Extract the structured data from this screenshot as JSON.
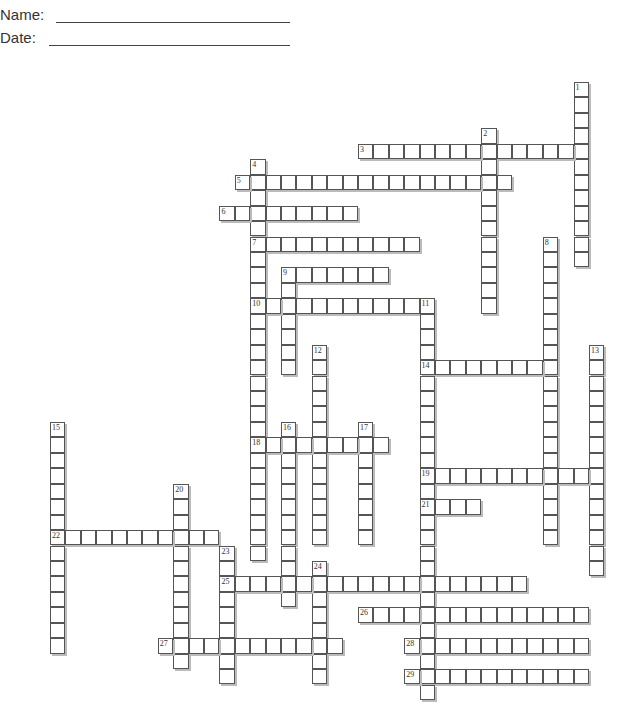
{
  "header": {
    "name_label": "Name:",
    "date_label": "Date:"
  },
  "grid": {
    "origin_x": 50,
    "origin_y": 82,
    "cell": 15.4,
    "cell_h": 15.45
  },
  "entries": [
    {
      "num": 1,
      "dir": "down",
      "row": 0,
      "col": 34,
      "len": 12
    },
    {
      "num": 2,
      "dir": "down",
      "row": 3,
      "col": 28,
      "len": 12
    },
    {
      "num": 3,
      "dir": "across",
      "row": 4,
      "col": 20,
      "len": 15
    },
    {
      "num": 4,
      "dir": "down",
      "row": 5,
      "col": 13,
      "len": 26
    },
    {
      "num": 5,
      "dir": "across",
      "row": 6,
      "col": 12,
      "len": 18
    },
    {
      "num": 6,
      "dir": "across",
      "row": 8,
      "col": 11,
      "len": 9
    },
    {
      "num": 7,
      "dir": "across",
      "row": 10,
      "col": 13,
      "len": 11
    },
    {
      "num": 8,
      "dir": "down",
      "row": 10,
      "col": 32,
      "len": 20
    },
    {
      "num": 9,
      "dir": "across",
      "row": 12,
      "col": 15,
      "len": 7
    },
    {
      "num": 9,
      "dir": "down",
      "row": 12,
      "col": 15,
      "len": 7
    },
    {
      "num": 10,
      "dir": "across",
      "row": 14,
      "col": 13,
      "len": 12
    },
    {
      "num": 11,
      "dir": "down",
      "row": 14,
      "col": 24,
      "len": 26
    },
    {
      "num": 12,
      "dir": "down",
      "row": 17,
      "col": 17,
      "len": 13
    },
    {
      "num": 13,
      "dir": "down",
      "row": 17,
      "col": 35,
      "len": 15
    },
    {
      "num": 14,
      "dir": "across",
      "row": 18,
      "col": 24,
      "len": 9
    },
    {
      "num": 15,
      "dir": "down",
      "row": 22,
      "col": 0,
      "len": 15
    },
    {
      "num": 16,
      "dir": "down",
      "row": 22,
      "col": 15,
      "len": 12
    },
    {
      "num": 17,
      "dir": "down",
      "row": 22,
      "col": 20,
      "len": 8
    },
    {
      "num": 18,
      "dir": "across",
      "row": 23,
      "col": 13,
      "len": 9
    },
    {
      "num": 19,
      "dir": "across",
      "row": 25,
      "col": 24,
      "len": 12
    },
    {
      "num": 20,
      "dir": "down",
      "row": 26,
      "col": 8,
      "len": 12
    },
    {
      "num": 21,
      "dir": "across",
      "row": 27,
      "col": 24,
      "len": 4
    },
    {
      "num": 22,
      "dir": "across",
      "row": 29,
      "col": 0,
      "len": 11
    },
    {
      "num": 23,
      "dir": "down",
      "row": 30,
      "col": 11,
      "len": 9
    },
    {
      "num": 24,
      "dir": "down",
      "row": 31,
      "col": 17,
      "len": 8
    },
    {
      "num": 25,
      "dir": "across",
      "row": 32,
      "col": 11,
      "len": 20
    },
    {
      "num": 26,
      "dir": "across",
      "row": 34,
      "col": 20,
      "len": 15
    },
    {
      "num": 27,
      "dir": "across",
      "row": 36,
      "col": 7,
      "len": 12
    },
    {
      "num": 28,
      "dir": "across",
      "row": 36,
      "col": 23,
      "len": 12
    },
    {
      "num": 29,
      "dir": "across",
      "row": 38,
      "col": 23,
      "len": 12
    }
  ]
}
